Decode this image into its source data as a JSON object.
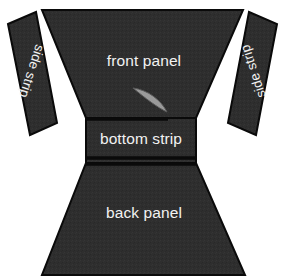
{
  "diagram": {
    "background_color": "#ffffff",
    "fabric_color": "#2e2e2e",
    "outline_color": "#0a0a0a",
    "label_color": "#f2f2f2",
    "accent_color": "#9a9a9a",
    "pieces": [
      {
        "id": "front-panel",
        "label": "front panel",
        "shape": "trapezoid",
        "label_x": 144,
        "label_y": 62,
        "rotation": 0,
        "points": "42,10 243,10 196,118 86,118"
      },
      {
        "id": "left-side-strip",
        "label": "side strip",
        "shape": "parallelogram",
        "label_x": 31,
        "label_y": 71,
        "rotation": 108,
        "points": "8,24 36,12 57,123 30,135"
      },
      {
        "id": "right-side-strip",
        "label": "side strip",
        "shape": "parallelogram",
        "label_x": 254,
        "label_y": 71,
        "rotation": -108,
        "points": "249,12 277,24 256,135 228,123"
      },
      {
        "id": "bottom-strip",
        "label": "bottom strip",
        "shape": "rectangle",
        "label_x": 141,
        "label_y": 140,
        "rotation": 0,
        "points": "86,118 196,118 196,163 86,163"
      },
      {
        "id": "back-panel",
        "label": "back panel",
        "shape": "trapezoid",
        "label_x": 144,
        "label_y": 214,
        "rotation": 0,
        "points": "86,163 196,163 245,275 42,275"
      }
    ],
    "seams": [
      {
        "id": "upper-seam",
        "points": "86,119 168,119"
      },
      {
        "id": "mid-seam",
        "points": "86,158 196,158"
      },
      {
        "id": "lower-seam",
        "points": "86,164 196,164"
      }
    ],
    "detail": {
      "id": "curved-sliver",
      "shape": "crescent",
      "color": "#9a9a9a",
      "path": "M133,88 C148,90 161,100 167,112 C158,108 145,98 133,88 Z"
    }
  }
}
